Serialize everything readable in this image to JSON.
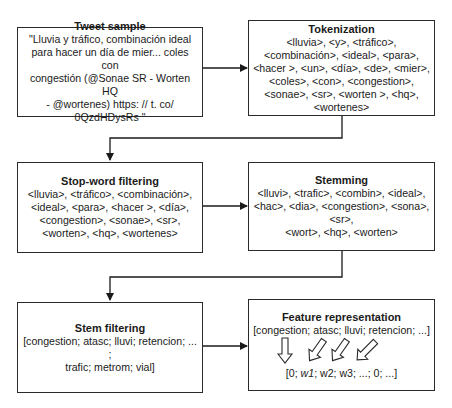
{
  "boxes": {
    "tweet": {
      "title": "Tweet sample",
      "body": "\"Lluvia y tráfico, combinación ideal\npara hacer un día de mier... coles con\ncongestión (@Sonae SR - Worten HQ\n- @wortenes) https: // t. co/\n0QzdHDysRs \""
    },
    "tokenization": {
      "title": "Tokenization",
      "body": "<lluvia>, <y>, <tráfico>,\n<combinación>, <ideal>, <para>,\n<hacer >, <un>, <día>, <de>, <mier>,\n<coles>, <con>, <congestion>,\n<sonae>, <sr>, <worten >, <hq>,\n<wortenes>"
    },
    "stopword": {
      "title": "Stop-word filtering",
      "body": "<lluvia>, <tráfico>, <combinación>,\n<ideal>, <para>, <hacer >, <día>,\n<congestion>, <sonae>, <sr>,\n<worten>, <hq>, <wortenes>"
    },
    "stemming": {
      "title": "Stemming",
      "body": "<lluvi>, <trafic>, <combin>, <ideal>,\n<hac>, <dia>, <congestion>, <sona>,\n<sr>,\n<wort>, <hq>, <worten>"
    },
    "stemfilter": {
      "title": "Stem filtering",
      "body": "[congestion; atasc; lluvi; retencion; ... ;\ntrafic; metrom; vial]"
    },
    "feature": {
      "title": "Feature representation",
      "terms": "[congestion; atasc; lluvi; retencion; ...]",
      "vector_prefix": "[0; ",
      "vector_w1": "w1",
      "vector_suffix": "; w2; w3; ...; 0; ...]"
    }
  },
  "colors": {
    "stroke": "#2a2a2a",
    "background": "#ffffff",
    "text": "#1a1a1a"
  }
}
